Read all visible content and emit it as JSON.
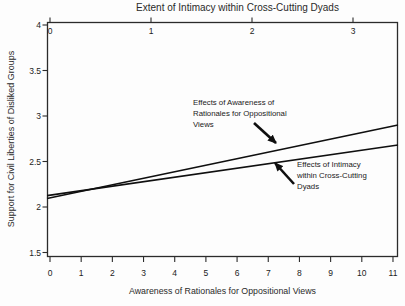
{
  "figure": {
    "background": "#fdfdfd",
    "line_color": "#0f0f0f",
    "axis_color": "#2b2b2b"
  },
  "chart_data": {
    "type": "line",
    "title": "",
    "top_axis": {
      "label": "Extent of Intimacy within Cross-Cutting Dyads",
      "ticks": [
        "0",
        "1",
        "2",
        "3"
      ],
      "range_hint": [
        -0.05,
        3.45
      ]
    },
    "bottom_axis": {
      "label": "Awareness of Rationales for Oppositional Views",
      "ticks": [
        "0",
        "1",
        "2",
        "3",
        "4",
        "5",
        "6",
        "7",
        "8",
        "9",
        "10",
        "11"
      ],
      "range_hint": [
        -0.1,
        11.2
      ]
    },
    "y_axis": {
      "label": "Support for Civil Liberties of Disliked Groups",
      "ticks": [
        "4",
        "3.5",
        "3",
        "2.5",
        "2",
        "1.5"
      ],
      "range_hint": [
        1.47,
        4.03
      ]
    },
    "grid": "off",
    "legend": "none",
    "series": [
      {
        "name": "Effects of Awareness of Rationales for Oppositional Views",
        "x_axis": "bottom",
        "points": [
          [
            0,
            2.1
          ],
          [
            11,
            2.89
          ]
        ]
      },
      {
        "name": "Effects of Intimacy within Cross-Cutting Dyads",
        "x_axis": "top",
        "points": [
          [
            0,
            2.13
          ],
          [
            3,
            2.61
          ]
        ]
      }
    ],
    "annotations": [
      {
        "lines": [
          "Effects of Awareness of",
          "Rationales for Oppositional",
          "Views"
        ],
        "target_series": 0
      },
      {
        "lines": [
          "Effects of Intimacy",
          "within Cross-Cutting",
          "Dyads"
        ],
        "target_series": 1
      }
    ]
  }
}
